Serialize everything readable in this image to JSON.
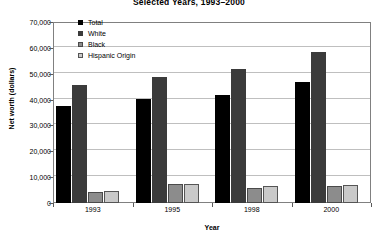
{
  "chart_data": {
    "type": "bar",
    "title": "Selected Years, 1993–2000",
    "xlabel": "Year",
    "ylabel": "Net worth (dollars)",
    "categories": [
      "1993",
      "1995",
      "1998",
      "2000"
    ],
    "ylim": [
      0,
      70000
    ],
    "yticks": [
      "0",
      "10,000",
      "20,000",
      "30,000",
      "40,000",
      "50,000",
      "60,000",
      "70,000"
    ],
    "ytick_values": [
      0,
      10000,
      20000,
      30000,
      40000,
      50000,
      60000,
      70000
    ],
    "grid": true,
    "legend_position": "upper-left-inside",
    "series": [
      {
        "name": "Total",
        "color": "#000000",
        "values": [
          37600,
          40200,
          41700,
          46700
        ]
      },
      {
        "name": "White",
        "color": "#3b3b3b",
        "values": [
          45700,
          48800,
          52000,
          58300
        ]
      },
      {
        "name": "Black",
        "color": "#8c8c8c",
        "values": [
          4400,
          7400,
          5900,
          6700
        ]
      },
      {
        "name": "Hispanic Origin",
        "color": "#c9c9c9",
        "values": [
          4700,
          7400,
          6500,
          7000
        ]
      }
    ]
  }
}
